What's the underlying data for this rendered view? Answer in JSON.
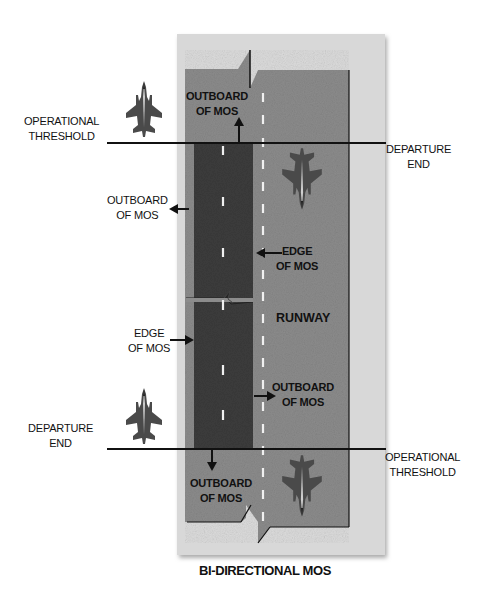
{
  "title": "BI-DIRECTIONAL MOS",
  "runway_label": "RUNWAY",
  "colors": {
    "background": "#ffffff",
    "panel": "#d6d6d6",
    "runway": "#8c8c8c",
    "mos": "#3a3a3a",
    "lines": "#111111",
    "centerline": "#f2f2f2"
  },
  "labels": {
    "op_threshold_top": {
      "line1": "OPERATIONAL",
      "line2": "THRESHOLD"
    },
    "departure_end_top": {
      "line1": "DEPARTURE",
      "line2": "END"
    },
    "outboard_top": {
      "line1": "OUTBOARD",
      "line2": "OF MOS"
    },
    "outboard_left": {
      "line1": "OUTBOARD",
      "line2": "OF MOS"
    },
    "edge_right": {
      "line1": "EDGE",
      "line2": "OF MOS"
    },
    "edge_left": {
      "line1": "EDGE",
      "line2": "OF MOS"
    },
    "outboard_right": {
      "line1": "OUTBOARD",
      "line2": "OF MOS"
    },
    "departure_end_bottom": {
      "line1": "DEPARTURE",
      "line2": "END"
    },
    "op_threshold_bottom": {
      "line1": "OPERATIONAL",
      "line2": "THRESHOLD"
    },
    "outboard_bottom": {
      "line1": "OUTBOARD",
      "line2": "OF MOS"
    }
  },
  "icons": [
    "fighter-jet-icon-top-left",
    "fighter-jet-icon-top-runway",
    "fighter-jet-icon-bottom-left",
    "fighter-jet-icon-bottom-runway"
  ]
}
